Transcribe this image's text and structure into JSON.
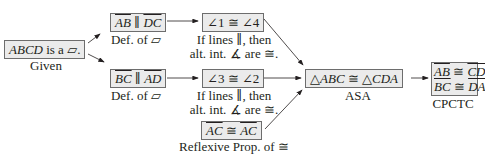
{
  "nodes": {
    "given": {
      "statement_italic": "ABCD",
      "statement_rest": " is a ",
      "symbol": "▱",
      "period": ".",
      "reason": "Given"
    },
    "ab_dc": {
      "seg1": "AB",
      "rel": " ∥ ",
      "seg2": "DC",
      "reason": "Def. of ▱"
    },
    "bc_ad": {
      "seg1": "BC",
      "rel": " ∥ ",
      "seg2": "AD",
      "reason": "Def. of ▱"
    },
    "ang14": {
      "statement": "∠1 ≅ ∠4",
      "reason_line1": "If lines ∥, then",
      "reason_line2": "alt. int. ∡ are ≅."
    },
    "ang32": {
      "statement": "∠3 ≅ ∠2",
      "reason_line1": "If lines ∥, then",
      "reason_line2": "alt. int. ∡ are ≅."
    },
    "ac_ac": {
      "seg1": "AC",
      "rel": " ≅ ",
      "seg2": "AC",
      "reason": "Reflexive Prop. of ≅"
    },
    "tri": {
      "t1": "△",
      "n1": "ABC",
      "rel": " ≅ ",
      "t2": "△",
      "n2": "CDA",
      "reason": "ASA"
    },
    "cpctc": {
      "l1s1": "AB",
      "l1rel": " ≅ ",
      "l1s2": "CD",
      "l2s1": "BC",
      "l2rel": " ≅ ",
      "l2s2": "DA",
      "reason": "CPCTC"
    }
  },
  "colors": {
    "box_fill": "#ebebeb",
    "box_border": "#6d6d6d",
    "arrow": "#231f20",
    "text": "#231f20"
  }
}
